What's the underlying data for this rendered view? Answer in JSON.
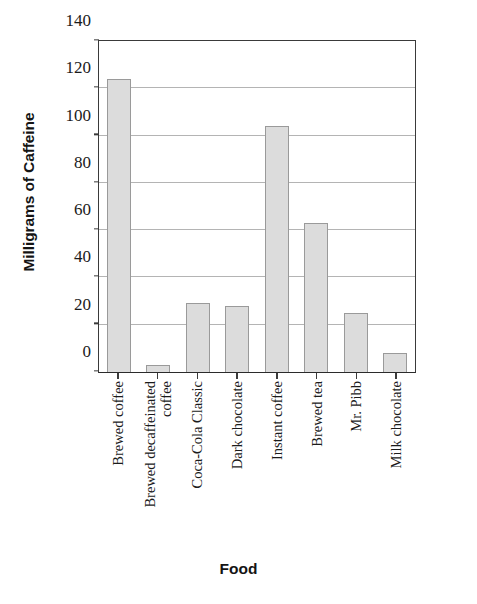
{
  "chart_data": {
    "type": "bar",
    "title": "",
    "xlabel": "Food",
    "ylabel": "Milligrams of Caffeine",
    "ylim": [
      0,
      140
    ],
    "yticks": [
      0,
      20,
      40,
      60,
      80,
      100,
      120,
      140
    ],
    "ytick_labels": [
      "0",
      "20",
      "40",
      "60",
      "80",
      "100",
      "120",
      "140"
    ],
    "grid": "horizontal",
    "legend": "none",
    "categories": [
      "Brewed coffee",
      "Brewed decaffeinated coffee",
      "Coca-Cola Classic",
      "Dark chocolate",
      "Instant coffee",
      "Brewed tea",
      "Mr. Pibb",
      "Milk chocolate"
    ],
    "category_lines": [
      [
        "Brewed coffee"
      ],
      [
        "Brewed decaffeinated",
        "coffee"
      ],
      [
        "Coca-Cola Classic"
      ],
      [
        "Dark chocolate"
      ],
      [
        "Instant coffee"
      ],
      [
        "Brewed tea"
      ],
      [
        "Mr. Pibb"
      ],
      [
        "Milk chocolate"
      ]
    ],
    "values": [
      124,
      3,
      29,
      28,
      104,
      63,
      25,
      8
    ],
    "bar_color": "#dcdcdc",
    "bar_edge_color": "#9a9a9a",
    "axis_color": "#3a3a3a",
    "grid_color": "#b4b4b4",
    "text_color": "#1b1b1b"
  }
}
